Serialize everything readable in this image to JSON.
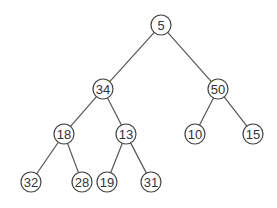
{
  "diagram": {
    "type": "binary-tree",
    "nodes": [
      {
        "id": "n0",
        "label": "5",
        "x": 161,
        "y": 25
      },
      {
        "id": "n1",
        "label": "34",
        "x": 103,
        "y": 89
      },
      {
        "id": "n2",
        "label": "50",
        "x": 218,
        "y": 89
      },
      {
        "id": "n3",
        "label": "18",
        "x": 64,
        "y": 134
      },
      {
        "id": "n4",
        "label": "13",
        "x": 126,
        "y": 134
      },
      {
        "id": "n5",
        "label": "10",
        "x": 195,
        "y": 134
      },
      {
        "id": "n6",
        "label": "15",
        "x": 253,
        "y": 134
      },
      {
        "id": "n7",
        "label": "32",
        "x": 31,
        "y": 182
      },
      {
        "id": "n8",
        "label": "28",
        "x": 82,
        "y": 182
      },
      {
        "id": "n9",
        "label": "19",
        "x": 107,
        "y": 182
      },
      {
        "id": "n10",
        "label": "31",
        "x": 151,
        "y": 182
      }
    ],
    "edges": [
      [
        "n0",
        "n1"
      ],
      [
        "n0",
        "n2"
      ],
      [
        "n1",
        "n3"
      ],
      [
        "n1",
        "n4"
      ],
      [
        "n2",
        "n5"
      ],
      [
        "n2",
        "n6"
      ],
      [
        "n3",
        "n7"
      ],
      [
        "n3",
        "n8"
      ],
      [
        "n4",
        "n9"
      ],
      [
        "n4",
        "n10"
      ]
    ],
    "node_radius": 10
  }
}
